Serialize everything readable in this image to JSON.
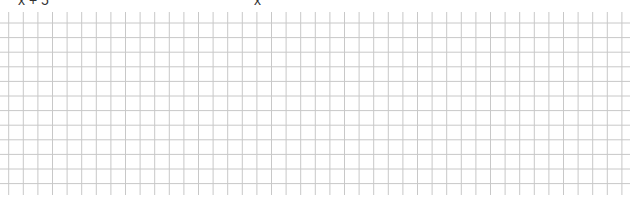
{
  "header": {
    "left_expression": "x + 5",
    "right_expression_prefix": "″",
    "right_expression": "x"
  },
  "grid": {
    "line_color": "#c8c8c8",
    "spacing": 14.6,
    "vertical_start_x": 8.7,
    "vertical_count": 43,
    "horizontal_start_y": 23,
    "horizontal_count": 12,
    "horizontal_left": 0,
    "horizontal_right": 630,
    "vertical_top": 12,
    "vertical_bottom": 195
  }
}
